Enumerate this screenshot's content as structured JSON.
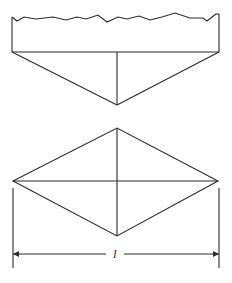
{
  "figure": {
    "top_view": {
      "description": "Cross-section with rough top surface over triangular base",
      "rough_edge_points": "12,17 17,21 24,17 36,19 53,17 66,20 77,17 86,19 98,15 107,22 118,17 127,19 139,16 150,20 162,17 175,13 190,18 203,18 207,21 216,14",
      "rect_left_x": 12,
      "rect_right_x": 219,
      "base_line_y": 52,
      "apex": [
        117,
        105
      ]
    },
    "bottom_view": {
      "description": "Rhombus with both diagonals",
      "left": [
        13,
        181
      ],
      "right": [
        218,
        181
      ],
      "top": [
        117,
        128
      ],
      "bottom": [
        117,
        236
      ]
    },
    "dimension": {
      "label": "l",
      "line_y": 254,
      "from_x": 13,
      "to_x": 219,
      "extension_top_y": 188,
      "extension_bottom_y": 268
    },
    "colors": {
      "stroke": "#2a2a2a",
      "background": "#ffffff"
    }
  }
}
